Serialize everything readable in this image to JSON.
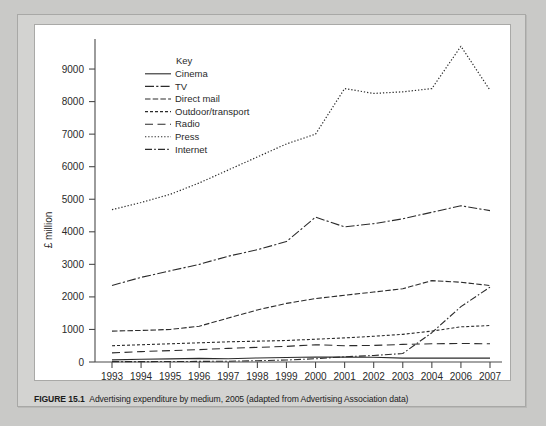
{
  "figure": {
    "caption_number": "FIGURE 15.1",
    "caption_text": "Advertising expenditure by medium, 2005 (adapted from Advertising Association data)"
  },
  "chart_data": {
    "type": "line",
    "title": "",
    "subtitle": "",
    "xlabel": "",
    "ylabel": "£ million",
    "categories": [
      "1993",
      "1994",
      "1995",
      "1996",
      "1997",
      "1998",
      "1999",
      "2000",
      "2001",
      "2002",
      "2003",
      "2004",
      "2006",
      "2007"
    ],
    "xtick_labels": [
      "1993",
      "1994",
      "1995",
      "1996",
      "1997",
      "1998",
      "1999",
      "2000",
      "2001",
      "2002",
      "2003",
      "2004",
      "2006",
      "2007"
    ],
    "ytick_labels": [
      "0",
      "1000",
      "2000",
      "3000",
      "4000",
      "5000",
      "6000",
      "7000",
      "8000",
      "9000"
    ],
    "ytick_values": [
      0,
      1000,
      2000,
      3000,
      4000,
      5000,
      6000,
      7000,
      8000,
      9000
    ],
    "ylim": [
      0,
      9800
    ],
    "grid": false,
    "legend_position": "inside-top-left",
    "legend_title": "Key",
    "series": [
      {
        "name": "Cinema",
        "style": "solid",
        "values": [
          65,
          85,
          95,
          110,
          100,
          125,
          140,
          155,
          150,
          145,
          120,
          120,
          120,
          120
        ]
      },
      {
        "name": "TV",
        "style": "dash-dot-dash",
        "values": [
          2350,
          2600,
          2800,
          3000,
          3250,
          3450,
          3700,
          4450,
          4150,
          4250,
          4400,
          4600,
          4800,
          4650
        ]
      },
      {
        "name": "Direct mail",
        "style": "dash-dash",
        "values": [
          950,
          970,
          1000,
          1100,
          1350,
          1600,
          1800,
          1950,
          2050,
          2150,
          2250,
          2500,
          2450,
          2350
        ]
      },
      {
        "name": "Outdoor/transport",
        "style": "short-dash",
        "values": [
          500,
          530,
          560,
          590,
          620,
          640,
          660,
          700,
          740,
          790,
          850,
          950,
          1080,
          1120
        ]
      },
      {
        "name": "Radio",
        "style": "long-dash",
        "values": [
          280,
          320,
          350,
          380,
          420,
          450,
          480,
          530,
          500,
          510,
          540,
          560,
          570,
          560
        ]
      },
      {
        "name": "Press",
        "style": "dotted",
        "values": [
          4680,
          4900,
          5150,
          5500,
          5900,
          6300,
          6700,
          7000,
          8400,
          8250,
          8300,
          8400,
          9700,
          8350
        ]
      },
      {
        "name": "Internet",
        "style": "dash-dot",
        "values": [
          10,
          12,
          15,
          18,
          25,
          40,
          60,
          100,
          160,
          200,
          260,
          900,
          1700,
          2300
        ]
      }
    ]
  }
}
